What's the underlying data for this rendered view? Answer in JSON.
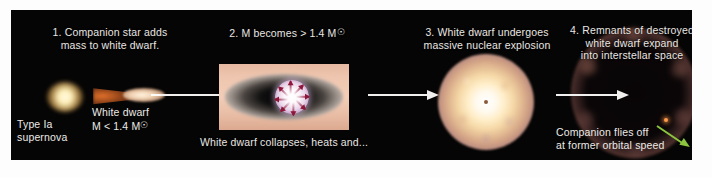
{
  "figure": {
    "background_color": "#ffffff",
    "panel_color": "#050505",
    "text_color": "#e9e6e2",
    "arrow_color": "#f2f0ee",
    "green_arrow_color": "#8cc63f"
  },
  "panels": [
    {
      "number": "1.",
      "heading": "1. Companion star adds\nmass to white dwarf.",
      "labels": {
        "type_label": "Type Ia\nsupernova",
        "white_dwarf_label": "White dwarf\nM < 1.4 M",
        "mass_symbol": "solar-mass-symbol"
      },
      "graphics": [
        "red-giant-star",
        "accretion-stream",
        "white-dwarf"
      ]
    },
    {
      "number": "2.",
      "heading": "2. M becomes > 1.4 M",
      "caption": "White dwarf collapses, heats and...",
      "graphics": [
        "accretion-disk",
        "collapsing-white-dwarf",
        "infall-arrows"
      ]
    },
    {
      "number": "3.",
      "heading": "3. White dwarf undergoes\nmassive nuclear explosion",
      "graphics": [
        "nuclear-explosion-fireball"
      ]
    },
    {
      "number": "4.",
      "heading": "4. Remnants of destroyed\nwhite dwarf expand\ninto interstellar space",
      "caption": "Companion flies off\nat former orbital speed",
      "graphics": [
        "expanding-remnant-shell",
        "companion-star",
        "velocity-arrow"
      ]
    }
  ]
}
